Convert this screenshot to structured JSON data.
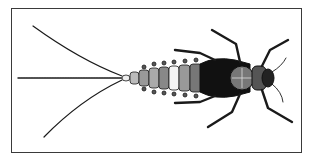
{
  "figure": {
    "colors": {
      "ink": "#1a1a1a",
      "frame": "#3a3a3a",
      "background": "#ffffff"
    }
  },
  "caption": {
    "text": "...",
    "cropped": true
  }
}
